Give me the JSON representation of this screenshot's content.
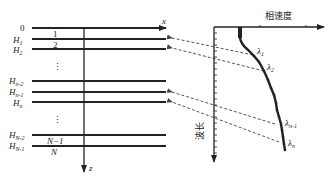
{
  "layer_model": {
    "x_axis_label": "x",
    "z_axis_label": "z",
    "surface_label": "0",
    "interfaces": [
      {
        "symbol": "H",
        "sub": "1",
        "y": 39
      },
      {
        "symbol": "H",
        "sub": "2",
        "y": 49
      },
      {
        "symbol": "H",
        "sub": "n-2",
        "y": 81
      },
      {
        "symbol": "H",
        "sub": "n-1",
        "y": 92
      },
      {
        "symbol": "H",
        "sub": "n",
        "y": 102
      },
      {
        "symbol": "H",
        "sub": "N-2",
        "y": 135
      },
      {
        "symbol": "H",
        "sub": "N-1",
        "y": 146
      }
    ],
    "layer_labels": {
      "l1": "1",
      "l2": "2",
      "lN1": "N−1",
      "lN": "N"
    },
    "ellipsis": "⋮"
  },
  "dispersion_curve": {
    "x_axis_label": "相速度",
    "y_axis_label": "波长",
    "points_labels": [
      {
        "symbol": "λ",
        "sub": "1"
      },
      {
        "symbol": "λ",
        "sub": "2"
      },
      {
        "symbol": "λ",
        "sub": "n-1"
      },
      {
        "symbol": "λ",
        "sub": "n"
      }
    ]
  }
}
